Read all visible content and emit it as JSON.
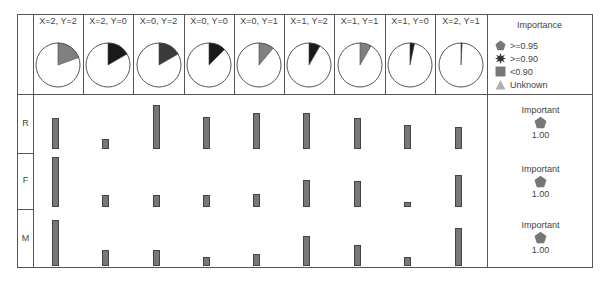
{
  "header": {
    "columns": [
      {
        "label": "X=2, Y=2",
        "slice_deg": 70,
        "slice_color": "#808080"
      },
      {
        "label": "X=2, Y=0",
        "slice_deg": 60,
        "slice_color": "#1a1a1a"
      },
      {
        "label": "X=0, Y=2",
        "slice_deg": 60,
        "slice_color": "#3a3a3a"
      },
      {
        "label": "X=0, Y=0",
        "slice_deg": 45,
        "slice_color": "#1a1a1a"
      },
      {
        "label": "X=0, Y=1",
        "slice_deg": 40,
        "slice_color": "#808080"
      },
      {
        "label": "X=1, Y=2",
        "slice_deg": 30,
        "slice_color": "#1a1a1a"
      },
      {
        "label": "X=1, Y=1",
        "slice_deg": 30,
        "slice_color": "#808080"
      },
      {
        "label": "X=1, Y=0",
        "slice_deg": 12,
        "slice_color": "#1a1a1a"
      },
      {
        "label": "X=2, Y=1",
        "slice_deg": 3,
        "slice_color": "#2a2a2a"
      }
    ]
  },
  "legend": {
    "title": "Importance",
    "items": [
      {
        "label": ">=0.95",
        "shape": "pentagon-icon",
        "color": "#777777"
      },
      {
        "label": ">=0.90",
        "shape": "star-burst-icon",
        "color": "#333333"
      },
      {
        "label": "<0.90",
        "shape": "square-icon",
        "color": "#777777"
      },
      {
        "label": "Unknown",
        "shape": "triangle-icon",
        "color": "#b0b0b0"
      }
    ]
  },
  "rows": [
    {
      "label": "R",
      "importance_label": "Important",
      "importance_value": "1.00",
      "bars": [
        31,
        10,
        44,
        32,
        36,
        36,
        31,
        24,
        22
      ]
    },
    {
      "label": "F",
      "importance_label": "Important",
      "importance_value": "1.00",
      "bars": [
        50,
        12,
        12,
        12,
        13,
        27,
        26,
        5,
        32
      ]
    },
    {
      "label": "M",
      "importance_label": "Important",
      "importance_value": "1.00",
      "bars": [
        46,
        16,
        16,
        9,
        12,
        30,
        21,
        9,
        38
      ]
    }
  ],
  "colors": {
    "bar_fill": "#777777",
    "bar_border": "#444444",
    "grid_line": "#555555",
    "pentagon": "#777777"
  }
}
